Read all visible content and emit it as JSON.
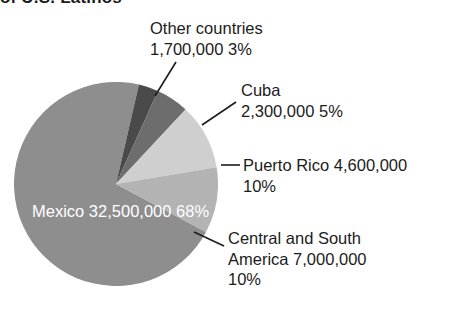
{
  "title": {
    "text": "of U.S. Latinos",
    "cropped": true
  },
  "chart_data": {
    "type": "pie",
    "title": "of U.S. Latinos",
    "xlabel": "",
    "ylabel": "",
    "legend": "none",
    "grid": false,
    "categories": [
      "Mexico",
      "Other countries",
      "Cuba",
      "Puerto Rico",
      "Central and South America"
    ],
    "values": [
      32500000,
      1700000,
      2300000,
      4600000,
      7000000
    ],
    "percentages": [
      68,
      3,
      5,
      10,
      10
    ],
    "value_labels": [
      "32,500,000",
      "1,700,000",
      "2,300,000",
      "4,600,000",
      "7,000,000"
    ],
    "percent_labels": [
      "68%",
      "3%",
      "5%",
      "10%",
      "10%"
    ],
    "colors": [
      "#8e8e8e",
      "#4a4a4a",
      "#6d6d6d",
      "#cfcfcf",
      "#b3b3b3"
    ]
  },
  "slices": {
    "mexico": {
      "name": "Mexico",
      "value": "32,500,000",
      "percent": "68%",
      "color": "#8e8e8e"
    },
    "other": {
      "name": "Other countries",
      "value": "1,700,000",
      "percent": "3%",
      "value_percent": "1,700,000  3%",
      "color": "#4a4a4a"
    },
    "cuba": {
      "name": "Cuba",
      "value": "2,300,000",
      "percent": "5%",
      "value_percent": "2,300,000  5%",
      "color": "#6d6d6d"
    },
    "puerto_rico": {
      "name_value": "Puerto Rico  4,600,000",
      "name": "Puerto Rico",
      "value": "4,600,000",
      "percent": "10%",
      "color": "#cfcfcf"
    },
    "central_south_america": {
      "name_line1": "Central and South",
      "name_line2_value": "America  7,000,000",
      "name": "Central and South America",
      "value": "7,000,000",
      "percent": "10%",
      "color": "#b3b3b3"
    }
  }
}
